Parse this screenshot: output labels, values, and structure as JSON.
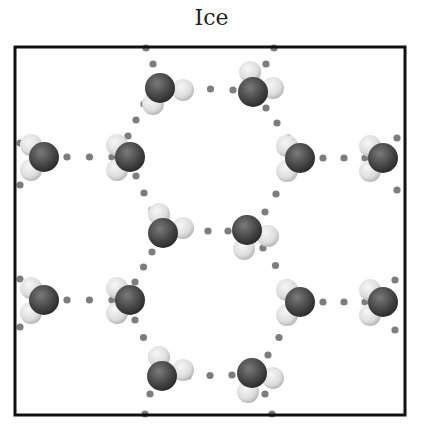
{
  "title": "Ice",
  "colors": {
    "oxygen": "#4a4a4a",
    "oxygen_highlight": "#7a7a7a",
    "hydrogen": "#e6e6e6",
    "hydrogen_shade": "#b8b8b8",
    "hbond_dot": "#7d7d7d",
    "frame": "#111111"
  },
  "frame": {
    "x": 15,
    "y": 47,
    "width": 390,
    "height": 368
  },
  "molecules": [
    {
      "id": "m1",
      "x": 160,
      "y": 88,
      "h": [
        [
          183,
          90
        ],
        [
          153,
          104
        ]
      ]
    },
    {
      "id": "m2",
      "x": 253,
      "y": 92,
      "h": [
        [
          250,
          72
        ],
        [
          273,
          88
        ]
      ]
    },
    {
      "id": "m3",
      "x": 44,
      "y": 157,
      "h": [
        [
          31,
          145
        ],
        [
          31,
          170
        ]
      ]
    },
    {
      "id": "m4",
      "x": 130,
      "y": 157,
      "h": [
        [
          117,
          145
        ],
        [
          117,
          170
        ]
      ]
    },
    {
      "id": "m5",
      "x": 300,
      "y": 158,
      "h": [
        [
          287,
          146
        ],
        [
          287,
          171
        ]
      ]
    },
    {
      "id": "m6",
      "x": 383,
      "y": 158,
      "h": [
        [
          370,
          146
        ],
        [
          370,
          171
        ]
      ]
    },
    {
      "id": "m7",
      "x": 163,
      "y": 233,
      "h": [
        [
          159,
          214
        ],
        [
          183,
          228
        ]
      ]
    },
    {
      "id": "m8",
      "x": 247,
      "y": 230,
      "h": [
        [
          268,
          236
        ],
        [
          244,
          249
        ]
      ]
    },
    {
      "id": "m9",
      "x": 44,
      "y": 300,
      "h": [
        [
          31,
          288
        ],
        [
          31,
          313
        ]
      ]
    },
    {
      "id": "m10",
      "x": 130,
      "y": 300,
      "h": [
        [
          117,
          288
        ],
        [
          117,
          313
        ]
      ]
    },
    {
      "id": "m11",
      "x": 300,
      "y": 302,
      "h": [
        [
          287,
          290
        ],
        [
          287,
          315
        ]
      ]
    },
    {
      "id": "m12",
      "x": 383,
      "y": 302,
      "h": [
        [
          370,
          290
        ],
        [
          370,
          315
        ]
      ]
    },
    {
      "id": "m13",
      "x": 162,
      "y": 376,
      "h": [
        [
          159,
          357
        ],
        [
          183,
          370
        ]
      ]
    },
    {
      "id": "m14",
      "x": 252,
      "y": 373,
      "h": [
        [
          273,
          378
        ],
        [
          248,
          392
        ]
      ]
    }
  ],
  "hbonds": [
    {
      "from": [
        188,
        88
      ],
      "to": [
        233,
        90
      ],
      "dots": 3
    },
    {
      "from": [
        67,
        157
      ],
      "to": [
        112,
        157
      ],
      "dots": 3
    },
    {
      "from": [
        323,
        158
      ],
      "to": [
        365,
        158
      ],
      "dots": 3
    },
    {
      "from": [
        188,
        231
      ],
      "to": [
        228,
        231
      ],
      "dots": 3
    },
    {
      "from": [
        67,
        300
      ],
      "to": [
        112,
        300
      ],
      "dots": 3
    },
    {
      "from": [
        323,
        302
      ],
      "to": [
        365,
        302
      ],
      "dots": 3
    },
    {
      "from": [
        188,
        376
      ],
      "to": [
        232,
        375
      ],
      "dots": 3
    },
    {
      "from": [
        146,
        48
      ],
      "to": [
        153,
        64
      ],
      "dots": 2
    },
    {
      "from": [
        144,
        104
      ],
      "to": [
        128,
        136
      ],
      "dots": 3
    },
    {
      "from": [
        274,
        48
      ],
      "to": [
        266,
        64
      ],
      "dots": 2
    },
    {
      "from": [
        266,
        108
      ],
      "to": [
        288,
        138
      ],
      "dots": 3
    },
    {
      "from": [
        136,
        176
      ],
      "to": [
        152,
        210
      ],
      "dots": 3
    },
    {
      "from": [
        287,
        176
      ],
      "to": [
        265,
        212
      ],
      "dots": 3
    },
    {
      "from": [
        152,
        252
      ],
      "to": [
        135,
        282
      ],
      "dots": 3
    },
    {
      "from": [
        263,
        248
      ],
      "to": [
        288,
        283
      ],
      "dots": 3
    },
    {
      "from": [
        135,
        320
      ],
      "to": [
        152,
        355
      ],
      "dots": 3
    },
    {
      "from": [
        290,
        320
      ],
      "to": [
        268,
        355
      ],
      "dots": 3
    },
    {
      "from": [
        150,
        394
      ],
      "to": [
        145,
        414
      ],
      "dots": 2
    },
    {
      "from": [
        265,
        394
      ],
      "to": [
        272,
        414
      ],
      "dots": 2
    },
    {
      "from": [
        20,
        143
      ],
      "to": [
        20,
        143
      ],
      "dots": 1
    },
    {
      "from": [
        20,
        185
      ],
      "to": [
        20,
        185
      ],
      "dots": 1
    },
    {
      "from": [
        20,
        279
      ],
      "to": [
        20,
        279
      ],
      "dots": 1
    },
    {
      "from": [
        20,
        327
      ],
      "to": [
        20,
        327
      ],
      "dots": 1
    },
    {
      "from": [
        397,
        138
      ],
      "to": [
        397,
        138
      ],
      "dots": 1
    },
    {
      "from": [
        397,
        190
      ],
      "to": [
        397,
        190
      ],
      "dots": 1
    },
    {
      "from": [
        395,
        280
      ],
      "to": [
        395,
        280
      ],
      "dots": 1
    },
    {
      "from": [
        395,
        330
      ],
      "to": [
        395,
        330
      ],
      "dots": 1
    }
  ]
}
